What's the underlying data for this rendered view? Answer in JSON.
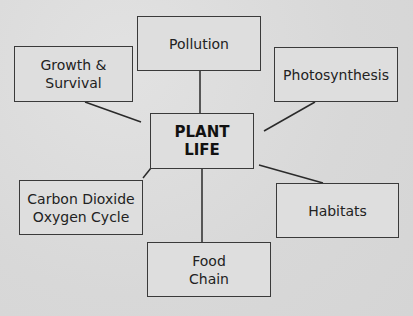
{
  "diagram": {
    "center": {
      "label": "PLANT\nLIFE"
    },
    "nodes": [
      {
        "id": "pollution",
        "label": "Pollution"
      },
      {
        "id": "growth",
        "label": "Growth &\nSurvival"
      },
      {
        "id": "photosynthesis",
        "label": "Photosynthesis"
      },
      {
        "id": "carbon",
        "label": "Carbon Dioxide\nOxygen Cycle"
      },
      {
        "id": "habitats",
        "label": "Habitats"
      },
      {
        "id": "food",
        "label": "Food\nChain"
      }
    ],
    "colors": {
      "background": "#dcdcdc",
      "border": "#3a3a3a",
      "text": "#222222"
    }
  }
}
